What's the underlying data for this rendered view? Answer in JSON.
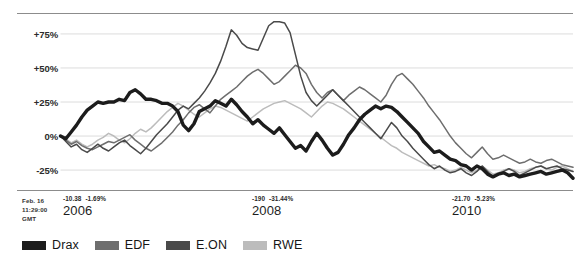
{
  "chart_data": {
    "type": "line",
    "title": "",
    "subtitle": "",
    "xlabel": "",
    "ylabel": "",
    "ylim": [
      -40,
      90
    ],
    "ytick_values": [
      75,
      50,
      25,
      0,
      -25
    ],
    "ytick_labels": [
      "+75%",
      "+50%",
      "+25%",
      "0%",
      "-25%"
    ],
    "grid": true,
    "legend_position": "bottom-left",
    "x_axis_type": "date",
    "x_tick_labels": [
      "2006",
      "2008",
      "2010"
    ],
    "x_tick_positions_pct": [
      8.5,
      49.5,
      84.0
    ],
    "series": [
      {
        "name": "Drax",
        "color": "#1c1c1c",
        "width": 3.4,
        "values": [
          0,
          -2,
          3,
          8,
          14,
          19,
          22,
          25,
          24,
          25,
          25,
          27,
          26,
          32,
          34,
          31,
          27,
          27,
          26,
          24,
          24,
          22,
          18,
          8,
          4,
          9,
          18,
          20,
          22,
          26,
          24,
          22,
          27,
          23,
          18,
          14,
          9,
          12,
          8,
          5,
          2,
          6,
          1,
          -4,
          -9,
          -7,
          -11,
          -4,
          2,
          -3,
          -9,
          -14,
          -12,
          -6,
          1,
          6,
          12,
          16,
          19,
          22,
          20,
          22,
          21,
          18,
          14,
          10,
          6,
          2,
          -4,
          -8,
          -12,
          -11,
          -14,
          -17,
          -18,
          -21,
          -22,
          -25,
          -22,
          -24,
          -28,
          -30,
          -28,
          -27,
          -29,
          -28,
          -30,
          -29,
          -28,
          -27,
          -26,
          -28,
          -27,
          -26,
          -25,
          -27,
          -31
        ]
      },
      {
        "name": "EDF",
        "color": "#6e6e6e",
        "width": 1.5,
        "values": [
          0,
          -3,
          -6,
          -4,
          -7,
          -9,
          -10,
          -8,
          -6,
          -4,
          -5,
          -3,
          -1,
          1,
          -3,
          -6,
          -9,
          -11,
          -8,
          -5,
          -1,
          3,
          8,
          12,
          17,
          21,
          23,
          20,
          17,
          22,
          27,
          30,
          33,
          36,
          40,
          44,
          47,
          49,
          46,
          42,
          38,
          40,
          44,
          48,
          52,
          50,
          46,
          38,
          32,
          28,
          32,
          34,
          30,
          26,
          30,
          33,
          36,
          34,
          31,
          28,
          25,
          30,
          38,
          44,
          46,
          42,
          38,
          33,
          28,
          22,
          17,
          12,
          6,
          0,
          -5,
          -9,
          -13,
          -16,
          -12,
          -8,
          -13,
          -17,
          -16,
          -14,
          -16,
          -18,
          -20,
          -19,
          -17,
          -19,
          -20,
          -18,
          -17,
          -19,
          -21,
          -22,
          -23
        ]
      },
      {
        "name": "E.ON",
        "color": "#4a4a4a",
        "width": 1.5,
        "values": [
          0,
          -4,
          -8,
          -6,
          -10,
          -12,
          -9,
          -6,
          -9,
          -11,
          -8,
          -5,
          -3,
          -7,
          -10,
          -13,
          -9,
          -4,
          1,
          5,
          9,
          14,
          19,
          22,
          20,
          24,
          28,
          33,
          39,
          46,
          55,
          66,
          78,
          74,
          68,
          65,
          64,
          63,
          72,
          81,
          84,
          84,
          83,
          76,
          60,
          44,
          32,
          26,
          22,
          26,
          30,
          34,
          30,
          26,
          22,
          18,
          14,
          10,
          6,
          2,
          -2,
          4,
          10,
          6,
          0,
          -4,
          -9,
          -13,
          -17,
          -21,
          -24,
          -22,
          -25,
          -27,
          -26,
          -24,
          -27,
          -29,
          -26,
          -22,
          -26,
          -30,
          -28,
          -26,
          -24,
          -26,
          -29,
          -27,
          -25,
          -23,
          -22,
          -24,
          -23,
          -22,
          -24,
          -25,
          -26
        ]
      },
      {
        "name": "RWE",
        "color": "#bcbcbc",
        "width": 1.5,
        "values": [
          0,
          -2,
          -5,
          -3,
          -6,
          -8,
          -6,
          -3,
          -1,
          2,
          0,
          -3,
          -5,
          -2,
          2,
          5,
          3,
          6,
          10,
          14,
          18,
          21,
          24,
          22,
          19,
          16,
          14,
          17,
          20,
          22,
          21,
          19,
          17,
          15,
          13,
          11,
          14,
          17,
          20,
          22,
          24,
          25,
          26,
          24,
          22,
          20,
          17,
          14,
          18,
          22,
          25,
          24,
          22,
          20,
          17,
          14,
          11,
          8,
          5,
          2,
          -1,
          -4,
          -7,
          -9,
          -12,
          -14,
          -16,
          -18,
          -20,
          -22,
          -21,
          -23,
          -24,
          -26,
          -25,
          -23,
          -25,
          -27,
          -25,
          -22,
          -25,
          -28,
          -27,
          -25,
          -24,
          -25,
          -27,
          -26,
          -24,
          -23,
          -22,
          -24,
          -25,
          -23,
          -22,
          -24,
          -26
        ]
      }
    ]
  },
  "axis": {
    "y_labels": [
      "+75%",
      "+50%",
      "+25%",
      "0%",
      "-25%"
    ]
  },
  "footer": {
    "timestamp": {
      "date": "Feb. 16",
      "time": "11:29:00",
      "zone": "GMT"
    },
    "years": [
      {
        "label": "2006",
        "change_abs": "-10.38",
        "change_pct": "-1.69%"
      },
      {
        "label": "2008",
        "change_abs": "-190",
        "change_pct": "-31.44%"
      },
      {
        "label": "2010",
        "change_abs": "-21.70",
        "change_pct": "-5.23%"
      }
    ]
  },
  "legend": {
    "items": [
      {
        "label": "Drax",
        "color": "#1c1c1c"
      },
      {
        "label": "EDF",
        "color": "#6e6e6e"
      },
      {
        "label": "E.ON",
        "color": "#4a4a4a"
      },
      {
        "label": "RWE",
        "color": "#bcbcbc"
      }
    ]
  },
  "colors": {
    "background": "#ffffff",
    "gridline": "#dcdcdc",
    "axisline": "#8c8c8c",
    "text": "#1a1a1a"
  }
}
